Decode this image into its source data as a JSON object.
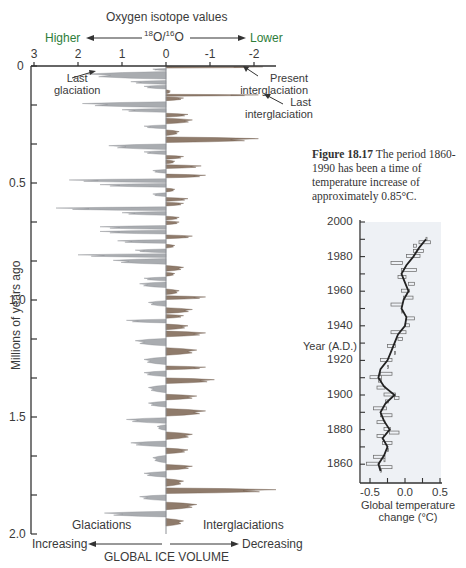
{
  "figure": {
    "caption_label": "Figure 18.17",
    "caption_text": " The period 1860-1990 has been a time of temperature increase of approximately 0.85°C."
  },
  "isotope_chart": {
    "title": "Oxygen isotope values",
    "ratio_label": "18O/16O",
    "ratio_sup1": "18",
    "ratio_base1": "O/",
    "ratio_sup2": "16",
    "ratio_base2": "O",
    "higher_label": "Higher",
    "lower_label": "Lower",
    "ylabel": "Millions of   years ago",
    "bottom_left": "Glaciations",
    "bottom_right": "Interglaciations",
    "ice_label": "GLOBAL ICE VOLUME",
    "increasing_label": "Increasing",
    "decreasing_label": "Decreasing",
    "annotations": {
      "last_glaciation_1": "Last",
      "last_glaciation_2": "glaciation",
      "present_1": "Present",
      "present_2": "interglaciation",
      "last_inter_1": "Last",
      "last_inter_2": "interglaciation"
    },
    "x_ticks": [
      "3",
      "2",
      "1",
      "0",
      "-1",
      "-2"
    ],
    "y_ticks": [
      "0",
      "0.5",
      "1.0",
      "1.5",
      "2.0"
    ],
    "colors": {
      "glacial": "#a9acb0",
      "interglacial": "#8f7b6b",
      "axis": "#333333",
      "accent": "#2e7d3a"
    }
  },
  "temp_chart": {
    "ylabel": "Year (A.D.)",
    "xlabel_1": "Global temperature",
    "xlabel_2": "change (°C)",
    "y_ticks": [
      "2000",
      "1980",
      "1960",
      "1940",
      "1920",
      "1900",
      "1880",
      "1860"
    ],
    "x_ticks": [
      "-0.5",
      "0.0",
      "0.5"
    ]
  },
  "chart_data": [
    {
      "type": "area",
      "title": "Oxygen isotope values 18O/16O",
      "xlabel": "18O/16O (Higher ← → Lower); GLOBAL ICE VOLUME (Increasing ← → Decreasing)",
      "ylabel": "Millions of years ago",
      "xlim": [
        3,
        -2.5
      ],
      "ylim": [
        0,
        2.0
      ],
      "x_ticks": [
        3,
        2,
        1,
        0,
        -1,
        -2
      ],
      "y_ticks": [
        0,
        0.5,
        1.0,
        1.5,
        2.0
      ],
      "legend": [
        "Glaciations (positive, grey)",
        "Interglaciations (negative, brown)"
      ],
      "annotations": [
        "Last glaciation (~0.02 Myr, ~1.8)",
        "Present interglaciation (0 Myr, ~-2.2)",
        "Last interglaciation (~0.12 Myr, ~-2.1)"
      ],
      "series": [
        {
          "name": "isotope_value",
          "age_myr": [
            0.0,
            0.01,
            0.02,
            0.06,
            0.08,
            0.1,
            0.12,
            0.13,
            0.15,
            0.18,
            0.2,
            0.22,
            0.25,
            0.27,
            0.3,
            0.33,
            0.36,
            0.38,
            0.4,
            0.42,
            0.44,
            0.46,
            0.48,
            0.5,
            0.52,
            0.54,
            0.56,
            0.58,
            0.6,
            0.62,
            0.64,
            0.66,
            0.68,
            0.7,
            0.72,
            0.74,
            0.76,
            0.78,
            0.8,
            0.82,
            0.85,
            0.88,
            0.9,
            0.92,
            0.95,
            0.98,
            1.0,
            1.03,
            1.06,
            1.08,
            1.1,
            1.13,
            1.16,
            1.2,
            1.24,
            1.28,
            1.3,
            1.33,
            1.36,
            1.4,
            1.43,
            1.46,
            1.5,
            1.53,
            1.56,
            1.6,
            1.63,
            1.66,
            1.7,
            1.73,
            1.76,
            1.8,
            1.83,
            1.86,
            1.9,
            1.93
          ],
          "value": [
            -2.2,
            0.3,
            1.8,
            0.8,
            0.5,
            -0.1,
            -2.1,
            -0.4,
            1.9,
            1.0,
            -0.5,
            -0.6,
            0.5,
            -0.3,
            -2.1,
            1.3,
            0.5,
            -0.4,
            -0.2,
            -0.8,
            0.3,
            -0.9,
            2.2,
            1.5,
            -0.2,
            0.3,
            -0.5,
            -0.4,
            2.5,
            1.0,
            -0.3,
            -0.3,
            1.5,
            1.5,
            -0.6,
            1.1,
            -0.2,
            0.7,
            2.0,
            1.2,
            -0.4,
            -0.2,
            0.5,
            0.6,
            -0.3,
            -0.9,
            0.4,
            -0.6,
            -0.4,
            0.9,
            -0.5,
            -0.9,
            0.7,
            -0.7,
            0.5,
            -0.9,
            0.5,
            -1.1,
            0.4,
            -0.7,
            0.4,
            -0.9,
            0.9,
            0.2,
            -0.6,
            0.8,
            -0.5,
            0.3,
            -0.6,
            0.5,
            -0.4,
            -2.5,
            0.6,
            -0.7,
            1.4,
            -0.4
          ]
        }
      ]
    },
    {
      "type": "line",
      "title": "Global temperature change 1860-1990",
      "xlabel": "Global temperature change (°C)",
      "ylabel": "Year (A.D.)",
      "xlim": [
        -0.75,
        0.5
      ],
      "ylim": [
        1855,
        2000
      ],
      "x_ticks": [
        -0.5,
        0.0,
        0.5
      ],
      "y_ticks": [
        1860,
        1880,
        1900,
        1920,
        1940,
        1960,
        1980,
        2000
      ],
      "series": [
        {
          "name": "smoothed",
          "year": [
            1856,
            1860,
            1865,
            1870,
            1875,
            1880,
            1885,
            1890,
            1895,
            1900,
            1905,
            1910,
            1915,
            1920,
            1925,
            1930,
            1935,
            1940,
            1945,
            1950,
            1955,
            1960,
            1965,
            1970,
            1975,
            1980,
            1985,
            1990
          ],
          "value": [
            -0.35,
            -0.38,
            -0.3,
            -0.25,
            -0.32,
            -0.22,
            -0.3,
            -0.35,
            -0.28,
            -0.15,
            -0.3,
            -0.38,
            -0.35,
            -0.25,
            -0.2,
            -0.15,
            -0.1,
            0.0,
            0.02,
            -0.05,
            -0.02,
            0.05,
            0.0,
            -0.05,
            0.02,
            0.12,
            0.2,
            0.3
          ]
        },
        {
          "name": "annual",
          "year": [
            1856,
            1858,
            1860,
            1862,
            1864,
            1868,
            1872,
            1876,
            1878,
            1880,
            1884,
            1888,
            1892,
            1896,
            1898,
            1900,
            1904,
            1908,
            1910,
            1912,
            1916,
            1920,
            1924,
            1928,
            1932,
            1936,
            1940,
            1944,
            1948,
            1952,
            1956,
            1960,
            1964,
            1968,
            1972,
            1976,
            1980,
            1983,
            1986,
            1988,
            1990
          ],
          "value": [
            -0.35,
            -0.2,
            -0.55,
            -0.3,
            -0.45,
            -0.25,
            -0.2,
            -0.4,
            -0.1,
            -0.22,
            -0.4,
            -0.2,
            -0.45,
            -0.25,
            -0.1,
            -0.15,
            -0.4,
            -0.35,
            -0.5,
            -0.2,
            -0.25,
            -0.35,
            -0.15,
            -0.25,
            -0.05,
            -0.2,
            0.05,
            0.12,
            -0.05,
            -0.2,
            0.1,
            -0.05,
            0.12,
            -0.1,
            0.15,
            -0.2,
            0.2,
            0.25,
            0.15,
            0.35,
            0.3
          ]
        }
      ]
    }
  ]
}
